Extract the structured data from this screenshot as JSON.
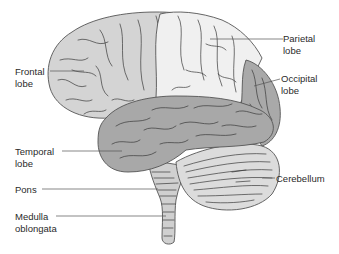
{
  "figure": {
    "type": "anatomical-diagram"
  },
  "colors": {
    "background": "#ffffff",
    "frontal": "#d4d4d4",
    "parietal": "#f0f0f0",
    "occipital": "#a9a9a9",
    "temporal": "#a8a8a8",
    "cerebellum": "#dcdcdc",
    "brainstem": "#d0d0d0",
    "text": "#2a2a2a"
  },
  "labels": {
    "frontal": "Frontal\nlobe",
    "parietal": "Parietal\nlobe",
    "occipital": "Occipital\nlobe",
    "temporal": "Temporal\nlobe",
    "pons": "Pons",
    "medulla": "Medulla\noblongata",
    "cerebellum": "Cerebellum"
  }
}
